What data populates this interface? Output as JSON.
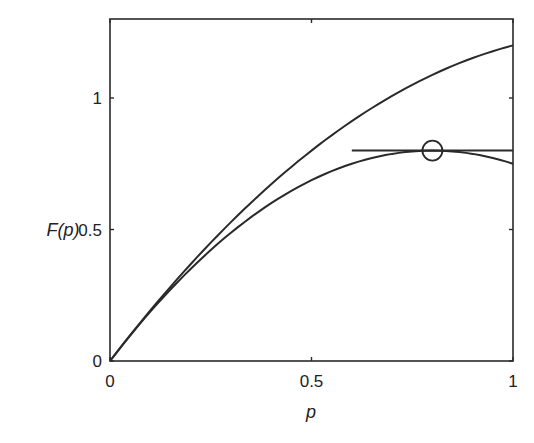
{
  "chart_data": {
    "type": "line",
    "title": "",
    "xlabel": "p",
    "ylabel": "F(p)",
    "xlim": [
      0,
      1
    ],
    "ylim": [
      0,
      1.3
    ],
    "grid": false,
    "legend": null,
    "x_ticks": [
      0,
      0.5,
      1
    ],
    "x_tick_labels": [
      "0",
      "0.5",
      "1"
    ],
    "y_ticks": [
      0,
      0.5,
      1
    ],
    "y_tick_labels": [
      "0",
      "0.5",
      "1"
    ],
    "x": [
      0,
      0.1,
      0.2,
      0.3,
      0.4,
      0.5,
      0.6,
      0.7,
      0.8,
      0.9,
      1.0
    ],
    "series": [
      {
        "name": "upper-curve",
        "values": [
          0,
          0.192,
          0.368,
          0.528,
          0.672,
          0.8,
          0.912,
          1.008,
          1.088,
          1.152,
          1.2
        ]
      },
      {
        "name": "lower-curve",
        "values": [
          0,
          0.1875,
          0.35,
          0.4875,
          0.6,
          0.6875,
          0.75,
          0.7875,
          0.8,
          0.7875,
          0.75
        ]
      },
      {
        "name": "horizontal-tangent",
        "x": [
          0.6,
          1.0
        ],
        "values": [
          0.8,
          0.8
        ]
      }
    ],
    "annotations": [
      {
        "type": "circle-marker",
        "x": 0.8,
        "y": 0.8
      }
    ]
  }
}
